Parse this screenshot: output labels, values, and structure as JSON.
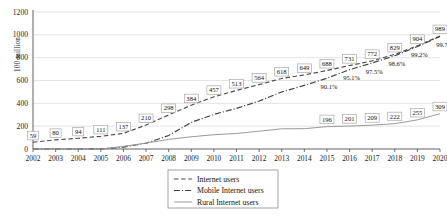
{
  "chart_data": {
    "type": "line",
    "title": "",
    "xlabel": "",
    "ylabel": "100 million",
    "ylim": [
      0,
      1200
    ],
    "yticks": [
      "0",
      "200",
      "400",
      "600",
      "800",
      "1000",
      "1200"
    ],
    "grid": true,
    "legend_position": "bottom-center",
    "categories": [
      "2002",
      "2003",
      "2004",
      "2005",
      "2006",
      "2007",
      "2008",
      "2009",
      "2010",
      "2011",
      "2012",
      "2013",
      "2014",
      "2015",
      "2016",
      "2017",
      "2018",
      "2019",
      "2020"
    ],
    "series": [
      {
        "name": "Internet users",
        "style": "dashed",
        "values": [
          59,
          80,
          94,
          111,
          137,
          210,
          298,
          384,
          457,
          513,
          564,
          618,
          649,
          688,
          731,
          772,
          829,
          904,
          989
        ],
        "labels": [
          "59",
          "80",
          "94",
          "111",
          "137",
          "210",
          "298",
          "384",
          "457",
          "513",
          "564",
          "618",
          "649",
          "688",
          "731",
          "772",
          "829",
          "904",
          "989"
        ]
      },
      {
        "name": "Mobile Internet users",
        "style": "dash-dot",
        "values": [
          0,
          0,
          0,
          1,
          17,
          50,
          118,
          233,
          303,
          356,
          420,
          500,
          557,
          620,
          695,
          753,
          817,
          897,
          986
        ],
        "annotations": [
          {
            "category": "2015",
            "text": "90.1%"
          },
          {
            "category": "2016",
            "text": "95.1%"
          },
          {
            "category": "2017",
            "text": "97.5%"
          },
          {
            "category": "2018",
            "text": "98.6%"
          },
          {
            "category": "2019",
            "text": "99.2%"
          },
          {
            "category": "2020",
            "text": "99.7"
          }
        ]
      },
      {
        "name": "Rural Internet users",
        "style": "solid",
        "values": [
          0,
          0,
          0,
          0,
          23,
          52,
          84,
          107,
          125,
          136,
          156,
          177,
          178,
          196,
          201,
          209,
          222,
          255,
          309
        ],
        "labels_partial": [
          {
            "category": "2015",
            "text": "196"
          },
          {
            "category": "2016",
            "text": "201"
          },
          {
            "category": "2017",
            "text": "209"
          },
          {
            "category": "2018",
            "text": "222"
          },
          {
            "category": "2019",
            "text": "255"
          },
          {
            "category": "2020",
            "text": "309"
          }
        ]
      }
    ],
    "legend": [
      {
        "label": "Internet users",
        "style": "dashed"
      },
      {
        "label": "Mobile Internet users",
        "style": "dash-dot"
      },
      {
        "label": "Rural Internet users",
        "style": "solid"
      }
    ],
    "colors": {
      "internet": "#4a4a4a",
      "mobile": "#3f3f3f",
      "rural": "#9a9a9a",
      "grid": "#d9d9d9",
      "axis": "#3a3a3a",
      "background": "#ffffff"
    }
  }
}
